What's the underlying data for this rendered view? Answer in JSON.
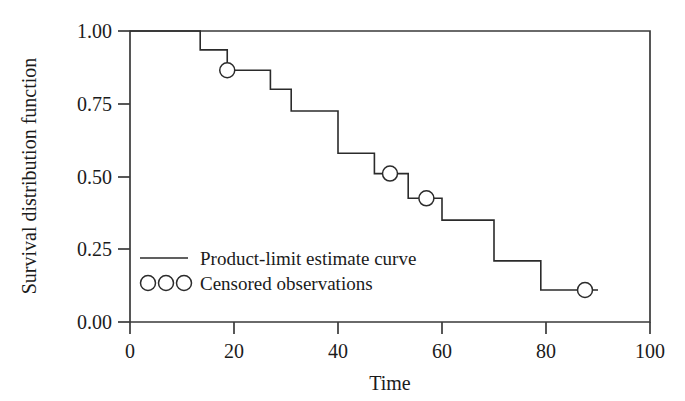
{
  "chart_data": {
    "type": "line",
    "title": "",
    "xlabel": "Time",
    "ylabel": "Survival distribution function",
    "xlim": [
      0,
      100
    ],
    "ylim": [
      0.0,
      1.0
    ],
    "grid": false,
    "x_ticks": [
      0,
      20,
      40,
      60,
      80,
      100
    ],
    "x_tick_labels": [
      "0",
      "20",
      "40",
      "60",
      "80",
      "100"
    ],
    "y_ticks": [
      0.0,
      0.25,
      0.5,
      0.75,
      1.0
    ],
    "y_tick_labels": [
      "0.00",
      "0.25",
      "0.50",
      "0.75",
      "1.00"
    ],
    "legend_position": "lower-left-inside",
    "series": [
      {
        "name": "Product-limit estimate curve",
        "style": "step-post",
        "x": [
          0,
          13.5,
          13.5,
          18.7,
          18.7,
          27.0,
          27.0,
          31.0,
          31.0,
          40.0,
          40.0,
          47.0,
          47.0,
          53.5,
          53.5,
          60.0,
          60.0,
          70.0,
          70.0,
          79.0,
          79.0,
          90.0
        ],
        "y": [
          1.0,
          1.0,
          0.935,
          0.935,
          0.865,
          0.865,
          0.8,
          0.8,
          0.725,
          0.725,
          0.58,
          0.58,
          0.51,
          0.51,
          0.425,
          0.425,
          0.35,
          0.35,
          0.21,
          0.21,
          0.11,
          0.11
        ]
      },
      {
        "name": "Censored observations",
        "style": "open-circle-markers",
        "points": [
          {
            "x": 18.7,
            "y": 0.865
          },
          {
            "x": 50.0,
            "y": 0.51
          },
          {
            "x": 57.0,
            "y": 0.425
          },
          {
            "x": 87.5,
            "y": 0.11
          }
        ]
      }
    ],
    "step_drops": [
      {
        "time": 13.5,
        "from": 1.0,
        "to": 0.935
      },
      {
        "time": 18.7,
        "from": 0.935,
        "to": 0.865
      },
      {
        "time": 27.0,
        "from": 0.865,
        "to": 0.8
      },
      {
        "time": 31.0,
        "from": 0.8,
        "to": 0.725
      },
      {
        "time": 40.0,
        "from": 0.725,
        "to": 0.58
      },
      {
        "time": 47.0,
        "from": 0.58,
        "to": 0.51
      },
      {
        "time": 53.5,
        "from": 0.51,
        "to": 0.425
      },
      {
        "time": 60.0,
        "from": 0.425,
        "to": 0.35
      },
      {
        "time": 70.0,
        "from": 0.35,
        "to": 0.21
      },
      {
        "time": 79.0,
        "from": 0.21,
        "to": 0.11
      }
    ],
    "colors": {
      "curve": "#2b2b2b",
      "frame": "#3a3a3a",
      "text": "#1b1b1b",
      "background": "#ffffff",
      "marker_fill": "#ffffff"
    }
  },
  "legend": {
    "entries": [
      {
        "label": "Product-limit estimate curve",
        "marker": "line"
      },
      {
        "label": "Censored observations",
        "marker": "circles"
      }
    ]
  },
  "axes": {
    "x_title": "Time",
    "y_title": "Survival distribution function",
    "x_tick_labels": [
      "0",
      "20",
      "40",
      "60",
      "80",
      "100"
    ],
    "y_tick_labels": [
      "1.00",
      "0.75",
      "0.50",
      "0.25",
      "0.00"
    ]
  }
}
